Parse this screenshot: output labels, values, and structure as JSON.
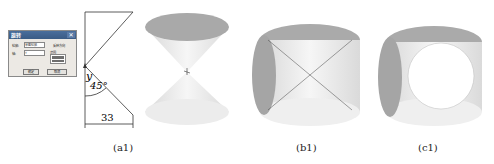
{
  "dialog": {
    "title": "旋转",
    "close_glyph": "✕",
    "field1_label": "轮廓:",
    "field1_value": "草图轮廓",
    "field2_label": "轴:",
    "field2_value": "Y",
    "option_label": "反转方向",
    "list_label": "范围",
    "ok_label": "确定",
    "cancel_label": "取消"
  },
  "sketch": {
    "axis_label": "y",
    "angle_label": "45°",
    "dimension_label": "33"
  },
  "captions": {
    "a1": "(a1)",
    "b1": "(b1)",
    "c1": "(c1)"
  },
  "colors": {
    "surface_dark": "#a9a9a9",
    "surface_light": "#ededed",
    "line": "#333333"
  }
}
